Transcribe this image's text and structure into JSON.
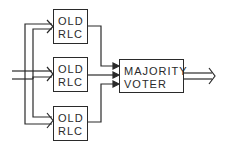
{
  "diagram": {
    "type": "block-diagram",
    "blocks": [
      {
        "id": "rlc1",
        "line1": "OLD",
        "line2": "RLC"
      },
      {
        "id": "rlc2",
        "line1": "OLD",
        "line2": "RLC"
      },
      {
        "id": "rlc3",
        "line1": "OLD",
        "line2": "RLC"
      },
      {
        "id": "voter",
        "line1": "MAJORITY",
        "line2": "VOTER"
      }
    ],
    "connections": [
      {
        "from": "input",
        "to": "rlc1",
        "style": "double-arrow"
      },
      {
        "from": "input",
        "to": "rlc2",
        "style": "double-arrow"
      },
      {
        "from": "input",
        "to": "rlc3",
        "style": "double-arrow"
      },
      {
        "from": "rlc1",
        "to": "voter",
        "style": "arrow"
      },
      {
        "from": "rlc2",
        "to": "voter",
        "style": "arrow"
      },
      {
        "from": "rlc3",
        "to": "voter",
        "style": "arrow"
      },
      {
        "from": "voter",
        "to": "output",
        "style": "double-arrow"
      }
    ],
    "line_color": "#2a2a2a",
    "background": "#ffffff"
  }
}
